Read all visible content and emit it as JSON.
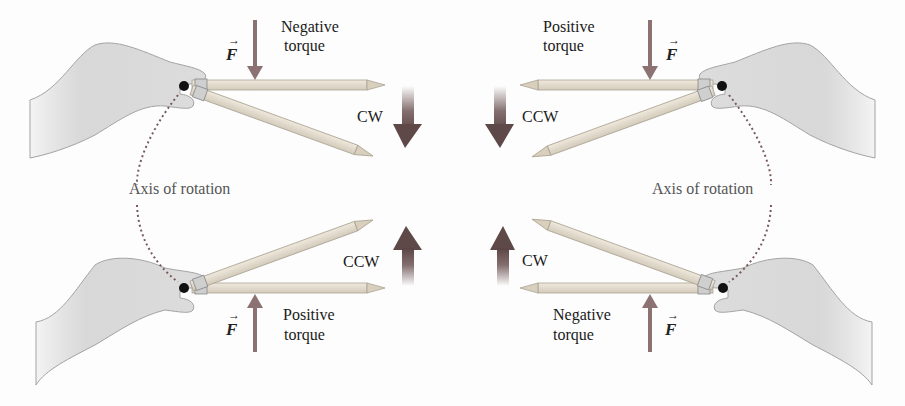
{
  "figure": {
    "colors": {
      "force_arrow": "#8c7272",
      "rotation_arrow": "#6e5555",
      "hand_fill": "#d9d9d9",
      "hand_stroke": "#9a9a9a",
      "pencil_fill": "#e2dccf",
      "pencil_stroke": "#a8a091",
      "pivot": "#111111",
      "axis_dots": "#7a5a5a"
    },
    "panels": [
      {
        "id": "top-left",
        "torque_line1": "Negative",
        "torque_line2": "torque",
        "force_label": "F",
        "rotation": "CW",
        "force_dir": "down"
      },
      {
        "id": "top-right",
        "torque_line1": "Positive",
        "torque_line2": "torque",
        "force_label": "F",
        "rotation": "CCW",
        "force_dir": "down"
      },
      {
        "id": "bottom-left",
        "torque_line1": "Positive",
        "torque_line2": "torque",
        "force_label": "F",
        "rotation": "CCW",
        "force_dir": "up"
      },
      {
        "id": "bottom-right",
        "torque_line1": "Negative",
        "torque_line2": "torque",
        "force_label": "F",
        "rotation": "CW",
        "force_dir": "up"
      }
    ],
    "axis_labels": {
      "left": "Axis of rotation",
      "right": "Axis of rotation"
    },
    "vector_arrow_glyph": "→"
  }
}
